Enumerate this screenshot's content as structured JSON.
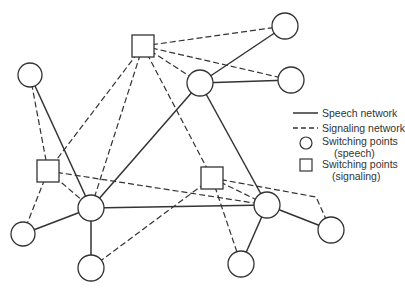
{
  "colors": {
    "stroke": "#333333",
    "background": "#ffffff"
  },
  "nodes": [
    {
      "id": "sq-top",
      "type": "signaling",
      "x": 143,
      "y": 46,
      "size": 22
    },
    {
      "id": "sq-left",
      "type": "signaling",
      "x": 48,
      "y": 171,
      "size": 22
    },
    {
      "id": "sq-center",
      "type": "signaling",
      "x": 212,
      "y": 178,
      "size": 22
    },
    {
      "id": "c-topleft",
      "type": "speech",
      "x": 30,
      "y": 75,
      "r": 12
    },
    {
      "id": "c-mid",
      "type": "speech",
      "x": 200,
      "y": 83,
      "r": 13
    },
    {
      "id": "c-topright",
      "type": "speech",
      "x": 285,
      "y": 26,
      "r": 13
    },
    {
      "id": "c-right",
      "type": "speech",
      "x": 291,
      "y": 80,
      "r": 13
    },
    {
      "id": "c-centerleft",
      "type": "speech",
      "x": 91,
      "y": 208,
      "r": 13
    },
    {
      "id": "c-centerright",
      "type": "speech",
      "x": 267,
      "y": 205,
      "r": 13
    },
    {
      "id": "c-farright",
      "type": "speech",
      "x": 331,
      "y": 230,
      "r": 13
    },
    {
      "id": "c-bottomleft",
      "type": "speech",
      "x": 23,
      "y": 234,
      "r": 12
    },
    {
      "id": "c-bottomcenter",
      "type": "speech",
      "x": 91,
      "y": 268,
      "r": 13
    },
    {
      "id": "c-bottomright",
      "type": "speech",
      "x": 241,
      "y": 264,
      "r": 13
    }
  ],
  "edges": [
    {
      "from": "c-topleft",
      "to": "c-centerleft",
      "type": "speech"
    },
    {
      "from": "c-mid",
      "to": "c-topright",
      "type": "speech"
    },
    {
      "from": "c-mid",
      "to": "c-right",
      "type": "speech"
    },
    {
      "from": "c-mid",
      "to": "c-centerleft",
      "type": "speech"
    },
    {
      "from": "c-mid",
      "to": "c-centerright",
      "type": "speech"
    },
    {
      "from": "c-centerleft",
      "to": "c-bottomleft",
      "type": "speech"
    },
    {
      "from": "c-centerleft",
      "to": "c-bottomcenter",
      "type": "speech"
    },
    {
      "from": "c-centerleft",
      "to": "c-centerright",
      "type": "speech"
    },
    {
      "from": "c-centerright",
      "to": "c-farright",
      "type": "speech"
    },
    {
      "from": "c-centerright",
      "to": "c-bottomright",
      "type": "speech"
    },
    {
      "from": "sq-top",
      "to": "c-topright",
      "type": "signaling"
    },
    {
      "from": "sq-top",
      "to": "c-right",
      "type": "signaling"
    },
    {
      "from": "sq-top",
      "to": "c-mid",
      "type": "signaling"
    },
    {
      "from": "sq-top",
      "to": "sq-left",
      "type": "signaling"
    },
    {
      "from": "sq-top",
      "to": "c-centerleft",
      "type": "signaling"
    },
    {
      "from": "sq-top",
      "to": "sq-center",
      "type": "signaling"
    },
    {
      "from": "c-topleft",
      "to": "sq-left",
      "type": "signaling"
    },
    {
      "from": "sq-left",
      "to": "c-bottomleft",
      "type": "signaling"
    },
    {
      "from": "sq-left",
      "to": "c-centerleft",
      "type": "signaling"
    },
    {
      "from": "sq-left",
      "to": "c-centerright",
      "type": "signaling"
    },
    {
      "from": "sq-center",
      "to": "c-centerright",
      "type": "signaling"
    },
    {
      "from": "sq-center",
      "to": "c-bottomcenter",
      "type": "signaling"
    },
    {
      "from": "sq-center",
      "to": "c-bottomright",
      "type": "signaling"
    },
    {
      "from": "sq-center",
      "to": "c-farright",
      "type": "signaling",
      "via": [
        [
          316,
          197
        ]
      ]
    }
  ],
  "legend": {
    "speech_network": "Speech network",
    "signaling_network": "Signaling network",
    "switching_speech_line1": "Switching points",
    "switching_speech_line2": "(speech)",
    "switching_signaling_line1": "Switching points",
    "switching_signaling_line2": "(signaling)"
  }
}
